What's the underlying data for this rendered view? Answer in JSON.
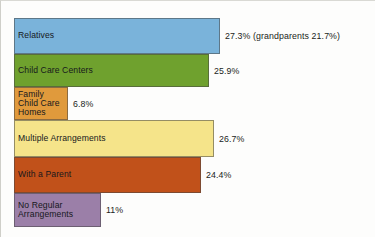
{
  "chart_data": {
    "type": "bar",
    "orientation": "horizontal",
    "title": "",
    "subtitle": "",
    "xlabel": "",
    "ylabel": "",
    "grid": false,
    "legend": "none",
    "xlim": [
      0,
      30
    ],
    "categories": [
      "Relatives",
      "Child Care Centers",
      "Family\nChild Care\nHomes",
      "Multiple Arrangements",
      "With a Parent",
      "No Regular\nArrangements"
    ],
    "values": [
      27.3,
      25.9,
      6.8,
      26.7,
      24.4,
      11
    ],
    "value_labels": [
      "27.3% (grandparents 21.7%)",
      "25.9%",
      "6.8%",
      "26.7%",
      "24.4%",
      "11%"
    ],
    "annotations": [
      {
        "category": "Relatives",
        "text": "grandparents 21.7%",
        "value": 21.7
      }
    ],
    "colors": [
      "#7ab3da",
      "#6fa12e",
      "#e09a3c",
      "#f5e48a",
      "#c1511a",
      "#9b7fa8"
    ]
  }
}
